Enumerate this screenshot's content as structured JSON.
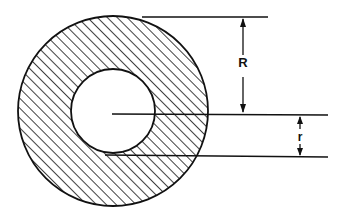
{
  "diagram": {
    "type": "annular cross-section (hollow circle / tube)",
    "colors": {
      "stroke": "#111111",
      "background": "#ffffff",
      "hatch": "#111111"
    },
    "outer_circle": {
      "cx": 113,
      "cy": 111,
      "r": 95
    },
    "inner_circle": {
      "cx": 113,
      "cy": 111,
      "r": 42
    },
    "hatching": {
      "angle_deg": 45,
      "spacing_px": 7
    },
    "dimensions": [
      {
        "id": "outer-radius",
        "label": "R",
        "meaning": "outer radius",
        "top_line": {
          "x1": 142,
          "y1": 17,
          "x2": 268,
          "y2": 17
        },
        "bottom_line": {
          "x1": 112,
          "y1": 114,
          "x2": 328,
          "y2": 115
        },
        "arrow_x": 243,
        "label_pos": {
          "x": 243,
          "y": 67
        }
      },
      {
        "id": "inner-radius",
        "label": "r",
        "meaning": "inner radius",
        "top_line": {
          "x1": 112,
          "y1": 114,
          "x2": 328,
          "y2": 115
        },
        "bottom_line": {
          "x1": 105,
          "y1": 155,
          "x2": 328,
          "y2": 157
        },
        "arrow_x": 300,
        "label_pos": {
          "x": 300,
          "y": 141
        }
      }
    ]
  }
}
